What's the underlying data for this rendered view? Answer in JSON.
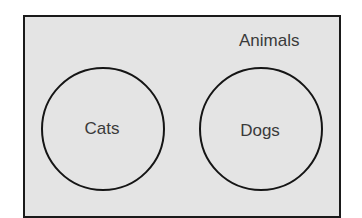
{
  "diagram": {
    "type": "venn",
    "universe": {
      "label": "Animals",
      "fill": "#e4e4e4",
      "border": "#1a1a1a"
    },
    "sets": [
      {
        "label": "Cats",
        "cx": 102,
        "cy": 128,
        "r": 61
      },
      {
        "label": "Dogs",
        "cx": 260,
        "cy": 129,
        "r": 61
      }
    ],
    "overlap": false
  }
}
